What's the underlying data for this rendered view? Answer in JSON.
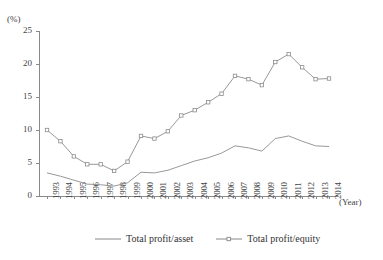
{
  "axis": {
    "y_unit_label": "(%)",
    "x_unit_label": "(Year)"
  },
  "legend": {
    "items": [
      {
        "label": "Total profit/asset",
        "marker": "none",
        "color": "#7a7a7a"
      },
      {
        "label": "Total profit/equity",
        "marker": "square",
        "color": "#7a7a7a"
      }
    ]
  },
  "chart_data": {
    "type": "line",
    "title": "",
    "xlabel": "(Year)",
    "ylabel": "(%)",
    "ylim": [
      0,
      25
    ],
    "yticks": [
      0,
      5,
      10,
      15,
      20,
      25
    ],
    "grid": false,
    "legend_position": "bottom",
    "categories": [
      "1993",
      "1994",
      "1995",
      "1996",
      "1997",
      "1998",
      "1999",
      "2000",
      "2001",
      "2002",
      "2003",
      "2004",
      "2005",
      "2006",
      "2007",
      "2008",
      "2009",
      "2010",
      "2011",
      "2012",
      "2013",
      "2014"
    ],
    "series": [
      {
        "name": "Total profit/asset",
        "marker": "none",
        "values": [
          3.5,
          3.0,
          2.4,
          1.8,
          1.7,
          1.5,
          2.0,
          3.6,
          3.5,
          3.9,
          4.6,
          5.3,
          5.8,
          6.5,
          7.6,
          7.3,
          6.8,
          8.7,
          9.1,
          8.3,
          7.6,
          7.5
        ]
      },
      {
        "name": "Total profit/equity",
        "marker": "square",
        "values": [
          10.0,
          8.3,
          6.0,
          4.8,
          4.8,
          3.8,
          5.2,
          9.1,
          8.7,
          9.8,
          12.2,
          13.0,
          14.2,
          15.5,
          18.2,
          17.7,
          16.8,
          20.3,
          21.5,
          19.5,
          17.7,
          17.8
        ]
      }
    ]
  }
}
